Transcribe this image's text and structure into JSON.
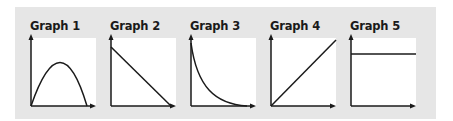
{
  "figure": {
    "background_color": "#e6e6e6",
    "plot_background": "#ffffff",
    "line_color": "#1a1a1a",
    "graphs": [
      {
        "title": "Graph 1",
        "shape": "inverted-parabola"
      },
      {
        "title": "Graph 2",
        "shape": "decreasing-line"
      },
      {
        "title": "Graph 3",
        "shape": "exponential-decay"
      },
      {
        "title": "Graph 4",
        "shape": "increasing-line"
      },
      {
        "title": "Graph 5",
        "shape": "horizontal-line"
      }
    ]
  }
}
